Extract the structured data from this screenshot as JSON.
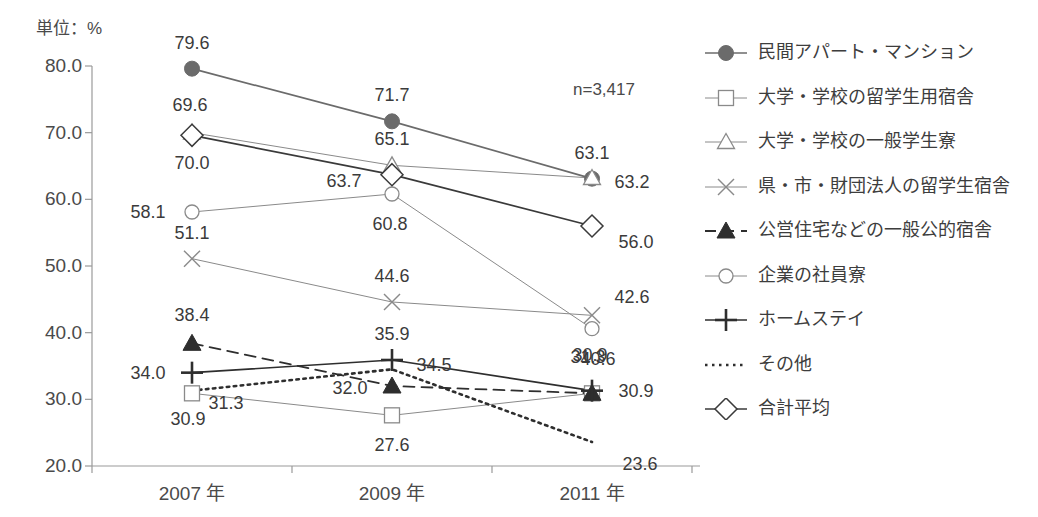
{
  "unit_label": "単位：%",
  "sample_note": "n=3,417",
  "chart_data": {
    "type": "line",
    "title": "",
    "subtitle": "",
    "xlabel": "",
    "ylabel": "単位：%",
    "unit": "%",
    "annotations": [
      "n=3,417"
    ],
    "grid": false,
    "legend_position": "right",
    "categories": [
      "2007 年",
      "2009 年",
      "2011 年"
    ],
    "ylim": [
      20.0,
      80.0
    ],
    "ytick_labels": [
      "80.0",
      "70.0",
      "60.0",
      "50.0",
      "40.0",
      "30.0",
      "20.0"
    ],
    "yticks": [
      80.0,
      70.0,
      60.0,
      50.0,
      40.0,
      30.0,
      20.0
    ],
    "series": [
      {
        "name": "民間アパート・マンション",
        "marker": "filled-circle",
        "line": "solid",
        "color": "#6b6b6b",
        "values": [
          79.6,
          71.7,
          63.1
        ],
        "labels": [
          "79.6",
          "71.7",
          "63.1"
        ]
      },
      {
        "name": "大学・学校の留学生用宿舎",
        "marker": "open-square",
        "line": "solid-thin",
        "color": "#8a8a8a",
        "values": [
          30.9,
          27.6,
          30.9
        ],
        "labels": [
          "30.9",
          "27.6",
          "30.9"
        ]
      },
      {
        "name": "大学・学校の一般学生寮",
        "marker": "open-triangle",
        "line": "solid-thin",
        "color": "#8a8a8a",
        "values": [
          70.0,
          65.1,
          63.2
        ],
        "labels": [
          "70.0",
          "65.1",
          "63.2"
        ]
      },
      {
        "name": "県・市・財団法人の留学生宿舎",
        "marker": "cross-x",
        "line": "solid-thin",
        "color": "#8a8a8a",
        "values": [
          51.1,
          44.6,
          42.6
        ],
        "labels": [
          "51.1",
          "44.6",
          "42.6"
        ]
      },
      {
        "name": "公営住宅などの一般公的宿舎",
        "marker": "filled-triangle",
        "line": "dashed",
        "color": "#2e2e2e",
        "values": [
          38.4,
          32.0,
          30.9
        ],
        "labels": [
          "38.4",
          "32.0",
          "30.9"
        ]
      },
      {
        "name": "企業の社員寮",
        "marker": "open-circle",
        "line": "solid-thin",
        "color": "#8a8a8a",
        "values": [
          58.1,
          60.8,
          40.6
        ],
        "labels": [
          "58.1",
          "60.8",
          "40.6"
        ]
      },
      {
        "name": "ホームステイ",
        "marker": "plus",
        "line": "solid",
        "color": "#2e2e2e",
        "values": [
          34.0,
          35.9,
          31.3
        ],
        "labels": [
          "34.0",
          "35.9",
          "31.3"
        ]
      },
      {
        "name": "その他",
        "marker": "none",
        "line": "dotted",
        "color": "#2e2e2e",
        "values": [
          31.3,
          34.5,
          23.6
        ],
        "labels": [
          "31.3",
          "34.5",
          "23.6"
        ]
      },
      {
        "name": "合計平均",
        "marker": "open-diamond",
        "line": "solid",
        "color": "#3a3a3a",
        "values": [
          69.6,
          63.7,
          56.0
        ],
        "labels": [
          "69.6",
          "63.7",
          "56.0"
        ]
      }
    ]
  },
  "colors": {
    "axis": "#9a9a9a",
    "text": "#3b3b3b",
    "dark_series": "#2e2e2e",
    "light_series": "#8a8a8a",
    "circle_fill": "#6b6b6b",
    "background": "#ffffff"
  }
}
